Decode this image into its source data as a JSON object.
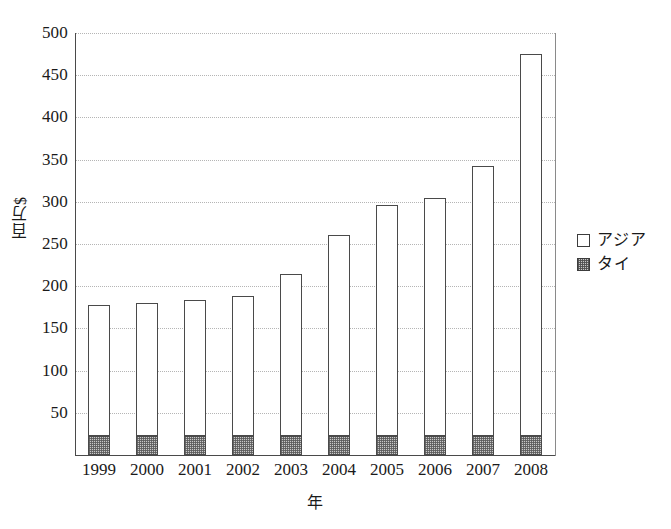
{
  "chart_data": {
    "type": "bar",
    "stacked": true,
    "title": "",
    "subtitle": "",
    "xlabel": "年",
    "ylabel": "百万$",
    "categories": [
      "1999",
      "2000",
      "2001",
      "2002",
      "2003",
      "2004",
      "2005",
      "2006",
      "2007",
      "2008"
    ],
    "series": [
      {
        "name": "タイ",
        "values": [
          22,
          22,
          22,
          22,
          23,
          22,
          22,
          22,
          22,
          23
        ],
        "color": "#c9c9c9",
        "pattern": "gray-stipple",
        "stack_order": "bottom"
      },
      {
        "name": "アジア",
        "values": [
          156,
          158,
          162,
          166,
          192,
          239,
          274,
          283,
          321,
          452
        ],
        "color": "#ffffff",
        "pattern": "empty",
        "stack_order": "top"
      }
    ],
    "totals": [
      178,
      180,
      184,
      188,
      215,
      261,
      296,
      305,
      343,
      475
    ],
    "ylim": [
      0,
      500
    ],
    "ytick_values": [
      0,
      50,
      100,
      150,
      200,
      250,
      300,
      350,
      400,
      450,
      500
    ],
    "ytick_labels": [
      "",
      "50",
      "100",
      "150",
      "200",
      "250",
      "300",
      "350",
      "400",
      "450",
      "500"
    ],
    "grid": "horizontal-dotted",
    "legend_position": "right",
    "legend_entries": [
      "アジア",
      "タイ"
    ]
  },
  "axes": {
    "y_title": "百万$",
    "x_title": "年"
  },
  "legend": {
    "items": [
      {
        "label": "アジア",
        "swatch": "empty-square-icon"
      },
      {
        "label": "タイ",
        "swatch": "hatched-square-icon"
      }
    ]
  }
}
